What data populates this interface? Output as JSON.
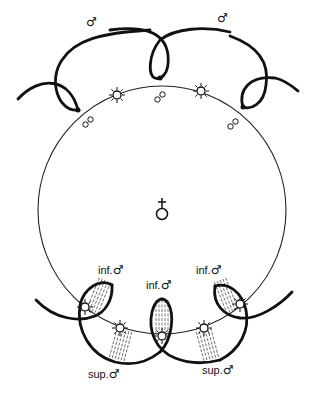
{
  "figure": {
    "type": "biological-diagram",
    "center_symbol": "female-symbol",
    "labels": {
      "top_left_male": "♂",
      "top_right_male": "♂",
      "inf_left": "inf.",
      "inf_center": "inf.",
      "inf_right": "inf.",
      "sup_left": "sup.",
      "sup_right": "sup.",
      "male_glyph": "♂",
      "pair_glyph": "∞",
      "female_glyph": "♀"
    },
    "colors": {
      "stroke": "#111111",
      "background": "#ffffff"
    }
  }
}
